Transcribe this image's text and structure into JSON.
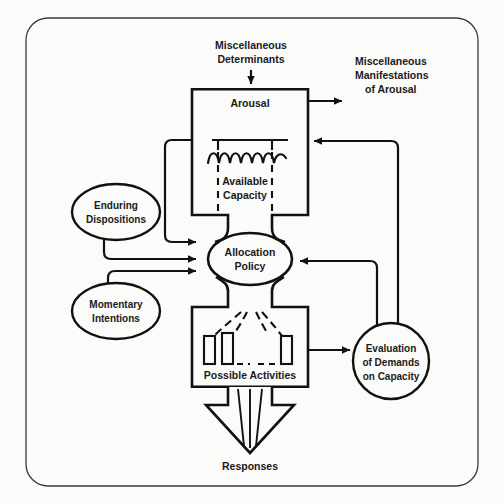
{
  "diagram": {
    "frame": {
      "shape": "rounded-rectangle",
      "stroke": "#3a3a3a"
    },
    "colors": {
      "background": "#fbfbfa",
      "ink": "#111111",
      "frame": "#3a3a3a",
      "text": "#1a1a1a"
    },
    "nodes": {
      "misc_determinants": {
        "label_line1": "Miscellaneous",
        "label_line2": "Determinants",
        "shape": "text"
      },
      "arousal": {
        "label": "Arousal",
        "shape": "funnel-box"
      },
      "available_capacity": {
        "label_line1": "Available",
        "label_line2": "Capacity",
        "shape": "dashed-region"
      },
      "misc_manifestations": {
        "label_line1": "Miscellaneous",
        "label_line2": "Manifestations",
        "label_line3": "of Arousal",
        "shape": "text"
      },
      "enduring_dispositions": {
        "label_line1": "Enduring",
        "label_line2": "Dispositions",
        "shape": "ellipse"
      },
      "momentary_intentions": {
        "label_line1": "Momentary",
        "label_line2": "Intentions",
        "shape": "ellipse"
      },
      "allocation_policy": {
        "label_line1": "Allocation",
        "label_line2": "Policy",
        "shape": "ellipse"
      },
      "possible_activities": {
        "label": "Possible Activities",
        "shape": "box"
      },
      "evaluation_of_demands": {
        "label_line1": "Evaluation",
        "label_line2": "of Demands",
        "label_line3": "on Capacity",
        "shape": "circle"
      },
      "responses": {
        "label": "Responses",
        "shape": "text"
      }
    },
    "edges": [
      {
        "name": "misc-determinants-to-arousal",
        "from": "misc_determinants",
        "to": "arousal",
        "style": "solid-arrow"
      },
      {
        "name": "arousal-to-misc-manifestations",
        "from": "arousal",
        "to": "misc_manifestations",
        "style": "solid-arrow"
      },
      {
        "name": "arousal-to-allocation-policy",
        "from": "arousal",
        "to": "allocation_policy",
        "style": "solid-arrow"
      },
      {
        "name": "enduring-dispositions-to-allocation-policy",
        "from": "enduring_dispositions",
        "to": "allocation_policy",
        "style": "solid-arrow"
      },
      {
        "name": "momentary-intentions-to-allocation-policy",
        "from": "momentary_intentions",
        "to": "allocation_policy",
        "style": "solid-arrow"
      },
      {
        "name": "evaluation-to-arousal-feedback",
        "from": "evaluation_of_demands",
        "to": "arousal",
        "style": "solid-arrow"
      },
      {
        "name": "evaluation-to-allocation-policy-feedback",
        "from": "evaluation_of_demands",
        "to": "allocation_policy",
        "style": "solid-arrow"
      },
      {
        "name": "possible-activities-to-evaluation",
        "from": "possible_activities",
        "to": "evaluation_of_demands",
        "style": "solid-arrow"
      },
      {
        "name": "allocation-policy-to-possible-activities",
        "from": "allocation_policy",
        "to": "possible_activities",
        "style": "funnel"
      },
      {
        "name": "possible-activities-to-responses",
        "from": "possible_activities",
        "to": "responses",
        "style": "block-arrow"
      }
    ]
  }
}
